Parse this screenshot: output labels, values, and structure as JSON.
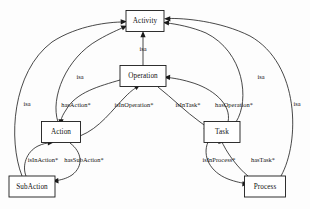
{
  "diagram": {
    "background_color": "#fdfdfd",
    "line_color": "#1a1a1a",
    "text_color": "#111111",
    "nodes": [
      {
        "id": "activity",
        "label": "Activity",
        "x": 145,
        "y": 21,
        "w": 38,
        "h": 21
      },
      {
        "id": "operation",
        "label": "Operation",
        "x": 143,
        "y": 76,
        "w": 46,
        "h": 21
      },
      {
        "id": "action",
        "label": "Action",
        "x": 61,
        "y": 132,
        "w": 39,
        "h": 21
      },
      {
        "id": "task",
        "label": "Task",
        "x": 222,
        "y": 132,
        "w": 36,
        "h": 21
      },
      {
        "id": "subaction",
        "label": "SubAction",
        "x": 32,
        "y": 186.5,
        "w": 46,
        "h": 21
      },
      {
        "id": "process",
        "label": "Process",
        "x": 265,
        "y": 186.5,
        "w": 41,
        "h": 21
      }
    ],
    "edges": [
      {
        "id": "operation-isa-activity",
        "label": "isa",
        "from": "operation",
        "to": "activity",
        "label_x": 143,
        "label_y": 50
      },
      {
        "id": "action-isa-activity",
        "label": "isa",
        "from": "action",
        "to": "activity",
        "label_x": 80,
        "label_y": 78
      },
      {
        "id": "subaction-isa-activity",
        "label": "isa",
        "from": "subaction",
        "to": "activity",
        "label_x": 27,
        "label_y": 105
      },
      {
        "id": "task-isa-activity",
        "label": "isa",
        "from": "task",
        "to": "activity",
        "label_x": 261,
        "label_y": 78
      },
      {
        "id": "process-isa-activity",
        "label": "isa",
        "from": "process",
        "to": "activity",
        "label_x": 297,
        "label_y": 105
      },
      {
        "id": "operation-hasaction-action",
        "label": "hasAction*",
        "from": "operation",
        "to": "action",
        "label_x": 76,
        "label_y": 106
      },
      {
        "id": "action-isinoperation-operation",
        "label": "isInOperation*",
        "from": "action",
        "to": "operation",
        "label_x": 134,
        "label_y": 106
      },
      {
        "id": "task-isintask-operation",
        "label": "isInTask*",
        "from": "operation",
        "to": "task",
        "label_x": 188,
        "label_y": 106
      },
      {
        "id": "task-hasoperation-operation",
        "label": "hasOperation*",
        "from": "task",
        "to": "operation",
        "label_x": 234,
        "label_y": 106
      },
      {
        "id": "subaction-isinaction-action",
        "label": "isInAction*",
        "from": "subaction",
        "to": "action",
        "label_x": 43,
        "label_y": 161
      },
      {
        "id": "action-hassubaction-subaction",
        "label": "hasSubAction*",
        "from": "action",
        "to": "subaction",
        "label_x": 84,
        "label_y": 161
      },
      {
        "id": "process-isinprocess-task",
        "label": "isInProcess*",
        "from": "process",
        "to": "task",
        "label_x": 219,
        "label_y": 161
      },
      {
        "id": "task-hastask-process",
        "label": "hasTask*",
        "from": "task",
        "to": "process",
        "label_x": 263,
        "label_y": 161
      }
    ]
  }
}
